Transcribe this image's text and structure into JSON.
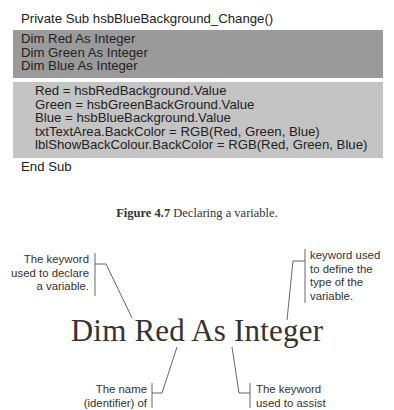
{
  "code_listing": {
    "header": "Private Sub hsbBlueBackground_Change()",
    "declarations": [
      "Dim Red As Integer",
      "Dim Green As Integer",
      "Dim Blue As Integer"
    ],
    "body": [
      "Red = hsbRedBackground.Value",
      "Green = hsbGreenBackGround.Value",
      "Blue = hsbBlueBackground.Value",
      "txtTextArea.BackColor = RGB(Red, Green, Blue)",
      "lblShowBackColour.BackColor = RGB(Red, Green, Blue)"
    ],
    "footer": "End Sub",
    "colors": {
      "declarations_bg": "#9a9a9a",
      "body_bg": "#c4c4c4"
    }
  },
  "caption": {
    "label": "Figure 4.7",
    "text": " Declaring a variable."
  },
  "diagram": {
    "statement": "Dim Red As Integer",
    "annotations": {
      "keyword_declare": [
        "The keyword",
        "used to declare",
        "a variable."
      ],
      "keyword_type": [
        "keyword used",
        "to define the",
        "type of the",
        "variable."
      ],
      "name_identifier": [
        "The name",
        "(identifier) of"
      ],
      "keyword_assist": [
        "The keyword",
        "used to assist"
      ]
    }
  }
}
